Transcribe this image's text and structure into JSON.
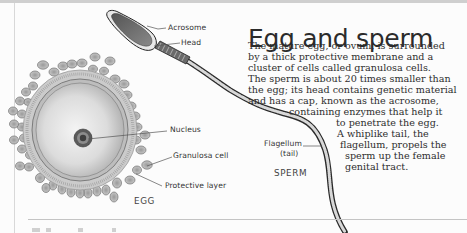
{
  "title": "Egg and sperm",
  "body_lines": [
    "The mature egg, or ovum, is surrounded",
    "by a thick protective membrane and a",
    "cluster of cells called granulosa cells.",
    "The sperm is about 20 times smaller than",
    "the egg; its head contains genetic material",
    "and has a cap, known as the acrosome,",
    "containing enzymes that help it",
    "to penetrate the egg.",
    "A whiplike tail, the",
    "flagellum, propels the",
    "sperm up the female",
    "genital tract."
  ],
  "egg": {
    "caption": "EGG",
    "labels": {
      "nucleus": "Nucleus",
      "granulosa": "Granulosa cell",
      "protective": "Protective layer"
    }
  },
  "sperm": {
    "caption": "SPERM",
    "labels": {
      "acrosome": "Acrosome",
      "head": "Head",
      "flagellum": "Flagellum",
      "flagellum_note": "(tail)"
    }
  },
  "colors": {
    "ink": "#2b2b2b",
    "egg_fill": "#d9d9d9",
    "egg_highlight": "#f2f2f2",
    "cell_fill": "#bdbdbd",
    "rule": "#c4c4c4"
  }
}
